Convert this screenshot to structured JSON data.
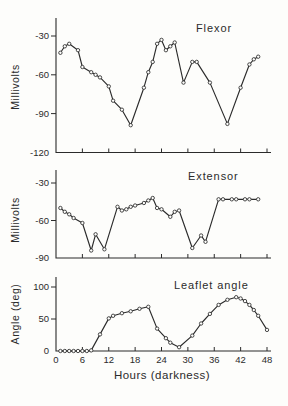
{
  "colors": {
    "ink": "#2b2b2b",
    "background": "#fdfdfb"
  },
  "x_axis": {
    "title": "Hours (darkness)",
    "tick_labels": [
      "0",
      "6",
      "12",
      "18",
      "24",
      "30",
      "36",
      "42",
      "48"
    ],
    "tick_hours": [
      0,
      6,
      12,
      18,
      24,
      30,
      36,
      42,
      48
    ],
    "xlim": [
      0,
      48
    ]
  },
  "chart_data": [
    {
      "type": "line",
      "title": "Flexor",
      "ylabel": "Millivolts",
      "xlabel": "Hours (darkness)",
      "ytick_labels": [
        "-30",
        "-60",
        "-90",
        "-120"
      ],
      "ytick_values": [
        -30,
        -60,
        -90,
        -120
      ],
      "ylim": [
        -120,
        -25
      ],
      "xlim": [
        0,
        48
      ],
      "marker": "open-circle",
      "points": [
        [
          1,
          -43
        ],
        [
          2,
          -38
        ],
        [
          3,
          -36
        ],
        [
          5,
          -41
        ],
        [
          6,
          -54
        ],
        [
          8,
          -58
        ],
        [
          9,
          -60
        ],
        [
          10,
          -62
        ],
        [
          12,
          -69
        ],
        [
          13,
          -80
        ],
        [
          15,
          -87
        ],
        [
          17,
          -99
        ],
        [
          20,
          -70
        ],
        [
          21,
          -58
        ],
        [
          22,
          -50
        ],
        [
          23,
          -36
        ],
        [
          24,
          -33
        ],
        [
          25,
          -41
        ],
        [
          26,
          -38
        ],
        [
          27,
          -35
        ],
        [
          29,
          -66
        ],
        [
          31,
          -50
        ],
        [
          32,
          -50
        ],
        [
          35,
          -66
        ],
        [
          39,
          -98
        ],
        [
          42,
          -70
        ],
        [
          44,
          -52
        ],
        [
          45,
          -48
        ],
        [
          46,
          -46
        ]
      ]
    },
    {
      "type": "line",
      "title": "Extensor",
      "ylabel": "Millivolts",
      "xlabel": "Hours (darkness)",
      "ytick_labels": [
        "-30",
        "-60",
        "-90"
      ],
      "ytick_values": [
        -30,
        -60,
        -90
      ],
      "ylim": [
        -90,
        -25
      ],
      "xlim": [
        0,
        48
      ],
      "marker": "open-circle",
      "points": [
        [
          1,
          -50
        ],
        [
          2,
          -53
        ],
        [
          3,
          -55
        ],
        [
          4,
          -58
        ],
        [
          6,
          -62
        ],
        [
          8,
          -84
        ],
        [
          9,
          -71
        ],
        [
          11,
          -83
        ],
        [
          14,
          -49
        ],
        [
          15,
          -52
        ],
        [
          16,
          -51
        ],
        [
          17,
          -49
        ],
        [
          18,
          -48
        ],
        [
          20,
          -46
        ],
        [
          21,
          -44
        ],
        [
          22,
          -42
        ],
        [
          23,
          -50
        ],
        [
          24,
          -51
        ],
        [
          26,
          -57
        ],
        [
          27,
          -53
        ],
        [
          28,
          -52
        ],
        [
          31,
          -82
        ],
        [
          33,
          -72
        ],
        [
          34,
          -77
        ],
        [
          37,
          -43
        ],
        [
          38,
          -43
        ],
        [
          40,
          -43
        ],
        [
          41,
          -43
        ],
        [
          43,
          -43
        ],
        [
          44,
          -43
        ],
        [
          46,
          -43
        ]
      ]
    },
    {
      "type": "line",
      "title": "Leaflet angle",
      "ylabel": "Angle (deg)",
      "xlabel": "Hours (darkness)",
      "ytick_labels": [
        "100",
        "50",
        "0"
      ],
      "ytick_values": [
        100,
        50,
        0
      ],
      "ylim": [
        0,
        110
      ],
      "xlim": [
        0,
        48
      ],
      "marker": "open-circle",
      "points": [
        [
          1,
          0
        ],
        [
          2,
          0
        ],
        [
          3,
          0
        ],
        [
          4,
          0
        ],
        [
          5,
          0
        ],
        [
          6,
          0
        ],
        [
          7,
          0
        ],
        [
          8,
          1
        ],
        [
          10,
          26
        ],
        [
          12,
          51
        ],
        [
          13,
          55
        ],
        [
          15,
          59
        ],
        [
          17,
          62
        ],
        [
          19,
          66
        ],
        [
          21,
          69
        ],
        [
          23,
          35
        ],
        [
          25,
          20
        ],
        [
          26,
          13
        ],
        [
          28,
          6
        ],
        [
          31,
          24
        ],
        [
          33,
          43
        ],
        [
          35,
          58
        ],
        [
          37,
          72
        ],
        [
          39,
          80
        ],
        [
          41,
          84
        ],
        [
          42,
          82
        ],
        [
          43,
          78
        ],
        [
          44,
          72
        ],
        [
          45,
          64
        ],
        [
          46,
          55
        ],
        [
          48,
          33
        ]
      ]
    }
  ]
}
